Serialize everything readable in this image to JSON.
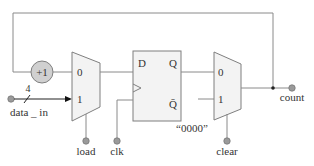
{
  "diagram": {
    "colors": {
      "wire": "#8a8a8a",
      "block_fill": "#f3f3f3",
      "block_stroke": "#7f7f7f",
      "incrementer_fill": "#d0d0d0",
      "text": "#333333"
    },
    "incrementer": {
      "label": "+1"
    },
    "mux_load": {
      "input0": "0",
      "input1": "1",
      "select": "load"
    },
    "flip_flop": {
      "d": "D",
      "q": "Q",
      "qbar": "Q̄"
    },
    "mux_clear": {
      "input0": "0",
      "input1": "1",
      "select": "clear",
      "constant": "“0000”"
    },
    "inputs": {
      "data_in": "data _ in",
      "bus_width": "4",
      "clk": "clk"
    },
    "outputs": {
      "count": "count"
    }
  }
}
